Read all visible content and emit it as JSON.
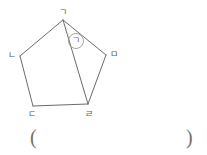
{
  "figure": {
    "type": "geometry-diagram",
    "shape": "pentagon",
    "background_color": "#ffffff",
    "stroke_color": "#6b6b6b",
    "label_color": "#5a5a5a",
    "vertices": [
      {
        "id": "A",
        "label": "ㄱ",
        "x": 63,
        "y": 20,
        "label_x": 59,
        "label_y": 8
      },
      {
        "id": "B",
        "label": "ㄴ",
        "x": 20,
        "y": 56,
        "label_x": 8,
        "label_y": 51
      },
      {
        "id": "C",
        "label": "ㄷ",
        "x": 33,
        "y": 106,
        "label_x": 28,
        "label_y": 110
      },
      {
        "id": "D",
        "label": "ㄹ",
        "x": 88,
        "y": 104,
        "label_x": 85,
        "label_y": 110
      },
      {
        "id": "E",
        "label": "ㅁ",
        "x": 106,
        "y": 55,
        "label_x": 110,
        "label_y": 50
      }
    ],
    "edges": [
      {
        "from": "A",
        "to": "B"
      },
      {
        "from": "B",
        "to": "C"
      },
      {
        "from": "C",
        "to": "D"
      },
      {
        "from": "D",
        "to": "E"
      },
      {
        "from": "E",
        "to": "A"
      }
    ],
    "diagonals": [
      {
        "from": "A",
        "to": "D"
      }
    ],
    "angle_marker": {
      "label": "ㄱ",
      "circle_cx": 76,
      "circle_cy": 41,
      "circle_r": 7.5,
      "text_x": 72,
      "text_y": 36
    }
  },
  "answer_blank": {
    "open_paren": "(",
    "close_paren": ")",
    "value": ""
  }
}
